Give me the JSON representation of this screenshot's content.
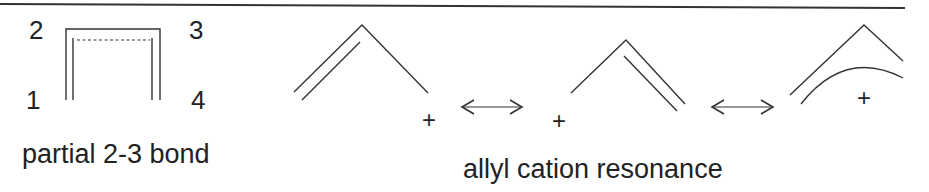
{
  "panels": {
    "partial_bond": {
      "atom_labels": [
        "1",
        "2",
        "3",
        "4"
      ],
      "caption": "partial 2-3 bond"
    },
    "allyl_cation": {
      "structures": [
        {
          "charge": "+",
          "charge_position": "right"
        },
        {
          "charge": "+",
          "charge_position": "left"
        },
        {
          "charge": "+",
          "charge_position": "center"
        }
      ],
      "resonance_arrows": [
        "<—>",
        "<—>"
      ],
      "caption": "allyl cation resonance"
    }
  },
  "colors": {
    "stroke": "#333333",
    "text": "#222222",
    "background": "#ffffff"
  }
}
